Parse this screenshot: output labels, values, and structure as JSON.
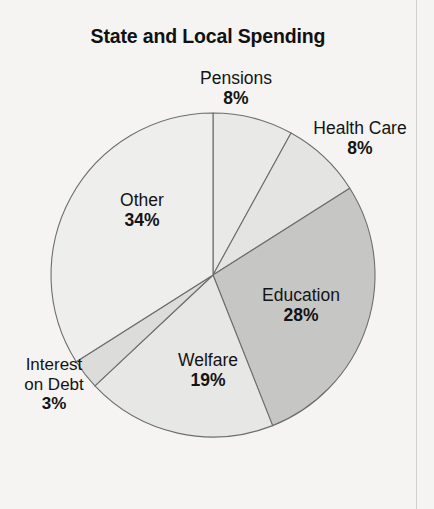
{
  "chart_data": {
    "type": "pie",
    "title": "State and Local Spending",
    "xlabel": "",
    "ylabel": "",
    "legend_position": "none",
    "labels_inline": true,
    "unit": "%",
    "start_angle_deg": 0,
    "direction": "clockwise",
    "categories": [
      "Pensions",
      "Health Care",
      "Education",
      "Welfare",
      "Interest on Debt",
      "Other"
    ],
    "values": [
      8,
      8,
      28,
      19,
      3,
      34
    ],
    "slices": [
      {
        "label": "Pensions",
        "value": 8,
        "pct_text": "8%",
        "color": "#e9e9e7",
        "start_deg": 0,
        "end_deg": 28.8
      },
      {
        "label": "Health Care",
        "value": 8,
        "pct_text": "8%",
        "color": "#e4e4e2",
        "start_deg": 28.8,
        "end_deg": 57.6
      },
      {
        "label": "Education",
        "value": 28,
        "pct_text": "28%",
        "color": "#c6c6c4",
        "start_deg": 57.6,
        "end_deg": 158.4
      },
      {
        "label": "Welfare",
        "value": 19,
        "pct_text": "19%",
        "color": "#e7e7e5",
        "start_deg": 158.4,
        "end_deg": 226.8
      },
      {
        "label": "Interest on Debt",
        "value": 3,
        "pct_text": "3%",
        "color": "#dcdcda",
        "start_deg": 226.8,
        "end_deg": 237.6
      },
      {
        "label": "Other",
        "value": 34,
        "pct_text": "34%",
        "color": "#eeeeec",
        "start_deg": 237.6,
        "end_deg": 360
      }
    ]
  },
  "title": "State and Local Spending",
  "labels": {
    "pensions": {
      "name": "Pensions",
      "pct": "8%"
    },
    "healthcare": {
      "name": "Health Care",
      "pct": "8%"
    },
    "education": {
      "name": "Education",
      "pct": "28%"
    },
    "welfare": {
      "name": "Welfare",
      "pct": "19%"
    },
    "other": {
      "name": "Other",
      "pct": "34%"
    },
    "interest": {
      "name_line1": "Interest",
      "name_line2": "on Debt",
      "pct": "3%"
    }
  },
  "geometry": {
    "cx": 213,
    "cy": 275,
    "r": 162
  },
  "colors": {
    "background": "#f5f4f2",
    "outline": "#6e6e6e",
    "text": "#141414",
    "education_fill": "#c6c6c4",
    "light_fill": "#eeeeec"
  }
}
